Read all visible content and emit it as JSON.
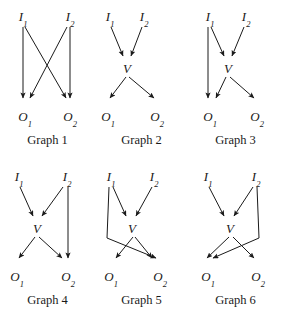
{
  "figure": {
    "width": 283,
    "height": 319,
    "background": "#ffffff",
    "ink_color": "#1a1a1a",
    "node_names": {
      "I1": "I",
      "I1_sub": "1",
      "I2": "I",
      "I2_sub": "2",
      "V": "V",
      "O1": "O",
      "O1_sub": "1",
      "O2": "O",
      "O2_sub": "2"
    },
    "graphs": [
      {
        "id": "graph-1",
        "caption": "Graph 1",
        "nodes": [
          "I1",
          "I2",
          "O1",
          "O2"
        ],
        "edges": [
          {
            "from": "I1",
            "to": "O1"
          },
          {
            "from": "I1",
            "to": "O2"
          },
          {
            "from": "I2",
            "to": "O1"
          },
          {
            "from": "I2",
            "to": "O2"
          }
        ]
      },
      {
        "id": "graph-2",
        "caption": "Graph 2",
        "nodes": [
          "I1",
          "I2",
          "V",
          "O1",
          "O2"
        ],
        "edges": [
          {
            "from": "I1",
            "to": "V"
          },
          {
            "from": "I2",
            "to": "V"
          },
          {
            "from": "V",
            "to": "O1"
          },
          {
            "from": "V",
            "to": "O2"
          }
        ]
      },
      {
        "id": "graph-3",
        "caption": "Graph 3",
        "nodes": [
          "I1",
          "I2",
          "V",
          "O1",
          "O2"
        ],
        "edges": [
          {
            "from": "I1",
            "to": "V"
          },
          {
            "from": "I2",
            "to": "V"
          },
          {
            "from": "V",
            "to": "O1"
          },
          {
            "from": "V",
            "to": "O2"
          },
          {
            "from": "I1",
            "to": "O1"
          }
        ]
      },
      {
        "id": "graph-4",
        "caption": "Graph 4",
        "nodes": [
          "I1",
          "I2",
          "V",
          "O1",
          "O2"
        ],
        "edges": [
          {
            "from": "I1",
            "to": "V"
          },
          {
            "from": "I2",
            "to": "V"
          },
          {
            "from": "V",
            "to": "O1"
          },
          {
            "from": "V",
            "to": "O2"
          },
          {
            "from": "I2",
            "to": "O2"
          }
        ]
      },
      {
        "id": "graph-5",
        "caption": "Graph 5",
        "nodes": [
          "I1",
          "I2",
          "V",
          "O1",
          "O2"
        ],
        "edges": [
          {
            "from": "I1",
            "to": "V"
          },
          {
            "from": "I2",
            "to": "V"
          },
          {
            "from": "V",
            "to": "O1"
          },
          {
            "from": "V",
            "to": "O2"
          },
          {
            "from": "I1",
            "to": "O2"
          }
        ]
      },
      {
        "id": "graph-6",
        "caption": "Graph 6",
        "nodes": [
          "I1",
          "I2",
          "V",
          "O1",
          "O2"
        ],
        "edges": [
          {
            "from": "I1",
            "to": "V"
          },
          {
            "from": "I2",
            "to": "V"
          },
          {
            "from": "V",
            "to": "O1"
          },
          {
            "from": "V",
            "to": "O2"
          },
          {
            "from": "I2",
            "to": "O1"
          }
        ]
      }
    ]
  }
}
